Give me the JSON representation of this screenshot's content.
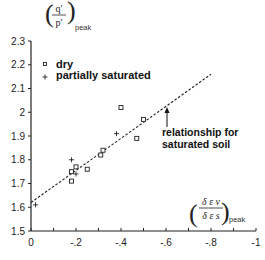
{
  "chart_data": {
    "type": "scatter",
    "title": "",
    "ylabel": "(q'/p')_peak",
    "ylabel_numerator": "q'",
    "ylabel_denominator": "p'",
    "ylabel_subscript": "peak",
    "xlabel": "(δε_v/δε_s)_peak",
    "xlabel_numerator": "δ ε v",
    "xlabel_denominator": "δ ε s",
    "xlabel_subscript": "peak",
    "xlim": [
      0,
      -1
    ],
    "ylim": [
      1.5,
      2.3
    ],
    "x_ticks": [
      0,
      -0.2,
      -0.4,
      -0.6,
      -0.8,
      -1
    ],
    "x_tick_labels": [
      "0",
      "-.2",
      "-.4",
      "-.6",
      "-.8",
      "-1"
    ],
    "y_ticks": [
      1.5,
      1.6,
      1.7,
      1.8,
      1.9,
      2.0,
      2.1,
      2.2,
      2.3
    ],
    "y_tick_labels": [
      "1.5",
      "1.6",
      "1.7",
      "1.8",
      "1.9",
      "2",
      "2.1",
      "2.2",
      "2.3"
    ],
    "grid": false,
    "legend_position": "upper-left",
    "series": [
      {
        "name": "dry",
        "marker": "square",
        "points": [
          {
            "x": -0.18,
            "y": 1.75
          },
          {
            "x": -0.18,
            "y": 1.71
          },
          {
            "x": -0.2,
            "y": 1.77
          },
          {
            "x": -0.25,
            "y": 1.76
          },
          {
            "x": -0.31,
            "y": 1.82
          },
          {
            "x": -0.32,
            "y": 1.84
          },
          {
            "x": -0.4,
            "y": 2.02
          },
          {
            "x": -0.47,
            "y": 1.89
          },
          {
            "x": -0.5,
            "y": 1.97
          }
        ]
      },
      {
        "name": "partially saturated",
        "marker": "plus",
        "points": [
          {
            "x": -0.02,
            "y": 1.61
          },
          {
            "x": -0.18,
            "y": 1.8
          },
          {
            "x": -0.2,
            "y": 1.74
          },
          {
            "x": -0.38,
            "y": 1.91
          }
        ]
      },
      {
        "name": "relationship for saturated soil",
        "type": "line",
        "style": "dashed",
        "points": [
          {
            "x": 0,
            "y": 1.62
          },
          {
            "x": -0.8,
            "y": 2.16
          }
        ]
      }
    ],
    "annotations": [
      {
        "text": "relationship for saturated soil",
        "arrow_to": {
          "x": -0.55,
          "y": 1.99
        }
      }
    ]
  },
  "legend": {
    "dry": "dry",
    "partially_saturated": "partially saturated"
  },
  "annotation": {
    "line1": "relationship for",
    "line2": "saturated soil"
  }
}
